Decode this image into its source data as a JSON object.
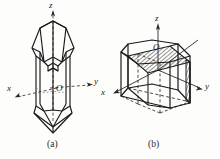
{
  "figure": {
    "background_color": "#fdfdfc",
    "ink_color": "#1a1a1a",
    "hatch_color": "#3a3a3a",
    "panels": [
      {
        "id": "a",
        "caption": "(a)",
        "subject": "quartz-crystal-with-axes",
        "axes": [
          {
            "name": "z",
            "label": "z",
            "direction": "up",
            "dashed": true
          },
          {
            "name": "x",
            "label": "x",
            "direction": "left-down",
            "dashed": true
          },
          {
            "name": "y",
            "label": "y",
            "direction": "right-down",
            "dashed": true
          }
        ],
        "origin": {
          "label": "O"
        }
      },
      {
        "id": "b",
        "caption": "(b)",
        "subject": "hexagonal-prism-with-shaded-plane",
        "axes": [
          {
            "name": "z",
            "label": "z",
            "direction": "up",
            "dashed": false
          },
          {
            "name": "x",
            "label": "x",
            "direction": "left-down",
            "dashed": false
          },
          {
            "name": "y",
            "label": "y",
            "direction": "right-down",
            "dashed": false
          }
        ],
        "origin": {
          "label": "O"
        },
        "shading": {
          "plane_label": "oblique-cleavage-plane",
          "side_label": "vertical-prism-face"
        }
      }
    ],
    "labels": {
      "panel_a_z": "z",
      "panel_a_x": "x",
      "panel_a_y": "y",
      "panel_a_origin": "O",
      "panel_a_caption": "(a)",
      "panel_b_z": "z",
      "panel_b_x": "x",
      "panel_b_y": "y",
      "panel_b_origin": "O",
      "panel_b_caption": "(b)"
    }
  }
}
